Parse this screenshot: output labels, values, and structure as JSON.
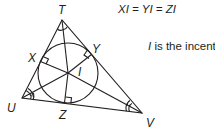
{
  "diagram": {
    "type": "triangle-incenter",
    "vertices": {
      "T": {
        "label": "T",
        "x": 62,
        "y": 20
      },
      "U": {
        "label": "U",
        "x": 22,
        "y": 98
      },
      "V": {
        "label": "V",
        "x": 142,
        "y": 113
      }
    },
    "incenter": {
      "label": "I",
      "x": 68,
      "y": 73
    },
    "incircle_radius": 30,
    "tangent_points": {
      "X": {
        "label": "X"
      },
      "Y": {
        "label": "Y"
      },
      "Z": {
        "label": "Z"
      }
    },
    "equation": "XI = YI = ZI",
    "note": {
      "subject": "I",
      "rest": " is the incenter."
    },
    "colors": {
      "stroke": "#231f20",
      "background": "#ffffff"
    }
  }
}
